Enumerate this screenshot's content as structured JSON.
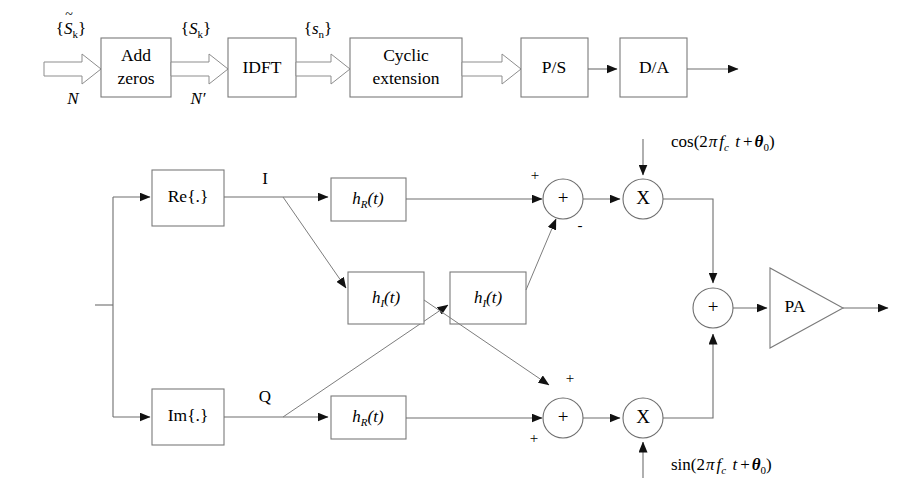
{
  "figure": {
    "colors": {
      "stroke": "#6e6e6e",
      "block_stroke": "#7a7a7a",
      "arrowhead": "#111111",
      "text": "#000000",
      "background": "#ffffff"
    }
  },
  "top_chain": {
    "blocks": [
      {
        "id": "add-zeros",
        "label_line1": "Add",
        "label_line2": "zeros"
      },
      {
        "id": "idft",
        "label_line1": "IDFT",
        "label_line2": ""
      },
      {
        "id": "cyclic-extension",
        "label_line1": "Cyclic",
        "label_line2": "extension"
      },
      {
        "id": "ps",
        "label_line1": "P/S",
        "label_line2": ""
      },
      {
        "id": "da",
        "label_line1": "D/A",
        "label_line2": ""
      }
    ],
    "signal_labels": [
      {
        "id": "s-tilde-k",
        "open": "{",
        "base": "S",
        "accent": "~",
        "sub": "k",
        "close": "}"
      },
      {
        "id": "s-k",
        "open": "{",
        "base": "S",
        "accent": "",
        "sub": "k",
        "close": "}"
      },
      {
        "id": "s-n",
        "open": "{",
        "base": "s",
        "accent": "",
        "sub": "n",
        "close": "}"
      }
    ],
    "width_labels": [
      {
        "id": "width-n",
        "text": "N"
      },
      {
        "id": "width-n-prime",
        "text": "N′"
      }
    ]
  },
  "lower_chain": {
    "blocks": [
      {
        "id": "re-block",
        "text": "Re{.}"
      },
      {
        "id": "im-block",
        "text": "Im{.}"
      },
      {
        "id": "hr-upper",
        "base": "h",
        "sub": "R",
        "arg": "(t)"
      },
      {
        "id": "hr-lower",
        "base": "h",
        "sub": "R",
        "arg": "(t)"
      },
      {
        "id": "hi-left",
        "base": "h",
        "sub": "I",
        "arg": "(t)"
      },
      {
        "id": "hi-right",
        "base": "h",
        "sub": "I",
        "arg": "(t)"
      },
      {
        "id": "pa",
        "text": "PA"
      }
    ],
    "branch_labels": [
      {
        "id": "label-i",
        "text": "I"
      },
      {
        "id": "label-q",
        "text": "Q"
      }
    ],
    "adders": [
      {
        "id": "adder-upper",
        "glyph": "+",
        "signs": [
          {
            "id": "adder-upper-sign-in",
            "text": "+"
          },
          {
            "id": "adder-upper-sign-cross",
            "text": "-"
          }
        ]
      },
      {
        "id": "adder-lower",
        "glyph": "+",
        "signs": [
          {
            "id": "adder-lower-sign-cross",
            "text": "+"
          },
          {
            "id": "adder-lower-sign-in",
            "text": "+"
          }
        ]
      },
      {
        "id": "adder-combine",
        "glyph": "+",
        "signs": []
      }
    ],
    "multipliers": [
      {
        "id": "mixer-i",
        "glyph": "X"
      },
      {
        "id": "mixer-q",
        "glyph": "X"
      }
    ],
    "carriers": [
      {
        "id": "carrier-cos",
        "fn": "cos(2",
        "pi": "π",
        "f": "f",
        "fsub": "c",
        "t": " t",
        "plus": "+",
        "theta": "θ",
        "thetasub": "0",
        "close": ")"
      },
      {
        "id": "carrier-sin",
        "fn": "sin(2",
        "pi": "π",
        "f": "f",
        "fsub": "c",
        "t": " t",
        "plus": "+",
        "theta": "θ",
        "thetasub": "0",
        "close": ")"
      }
    ]
  }
}
